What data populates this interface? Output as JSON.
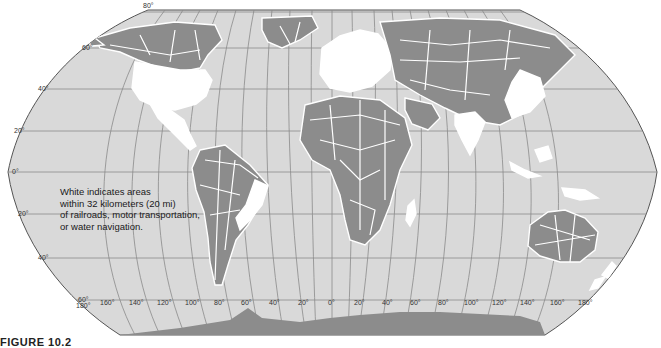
{
  "map": {
    "projection": "Robinson",
    "colors": {
      "ocean": "#d9d9d9",
      "land_remote": "#8c8c8c",
      "land_accessible": "#ffffff",
      "graticule": "#8a8a8a",
      "border": "#555555"
    },
    "latitude_labels_left": [
      {
        "text": "80°",
        "y": 10
      },
      {
        "text": "60°",
        "y": 48
      },
      {
        "text": "40°",
        "y": 89
      },
      {
        "text": "20°",
        "y": 131
      },
      {
        "text": "0°",
        "y": 172
      },
      {
        "text": "20°",
        "y": 214
      },
      {
        "text": "40°",
        "y": 258
      },
      {
        "text": "60°",
        "y": 300
      }
    ],
    "longitude_labels_bottom": [
      "180°",
      "160°",
      "140°",
      "120°",
      "100°",
      "80°",
      "60°",
      "40°",
      "20°",
      "0°",
      "20°",
      "40°",
      "60°",
      "80°",
      "100°",
      "120°",
      "140°",
      "160°",
      "180°"
    ]
  },
  "legend": {
    "lines": [
      "White indicates areas",
      "within 32 kilometers (20 mi)",
      "of railroads, motor transportation,",
      "or water navigation."
    ]
  },
  "caption": {
    "text": "FIGURE 10.2"
  }
}
